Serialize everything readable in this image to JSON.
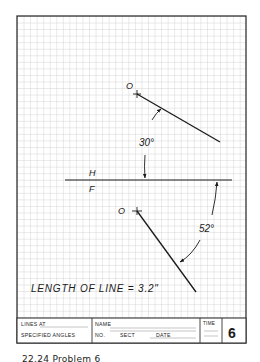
{
  "sheet": {
    "labels": {
      "top_point": "O",
      "bottom_point": "O",
      "fold_top": "H",
      "fold_bottom": "F",
      "angle_top": "30°",
      "angle_bottom": "52°",
      "length_note": "LENGTH OF LINE = 3.2\""
    },
    "title_block": {
      "title_line1": "LINES AT",
      "title_line2": "SPECIFIED ANGLES",
      "name_label": "NAME",
      "no_label": "NO.",
      "sect_label": "SECT",
      "date_label": "DATE",
      "time_label": "TIME",
      "problem_number": "6"
    }
  },
  "caption": "22.24 Problem 6",
  "colors": {
    "grid": "#c8c8c8",
    "ink": "#1a1a1a",
    "border": "#333333"
  }
}
